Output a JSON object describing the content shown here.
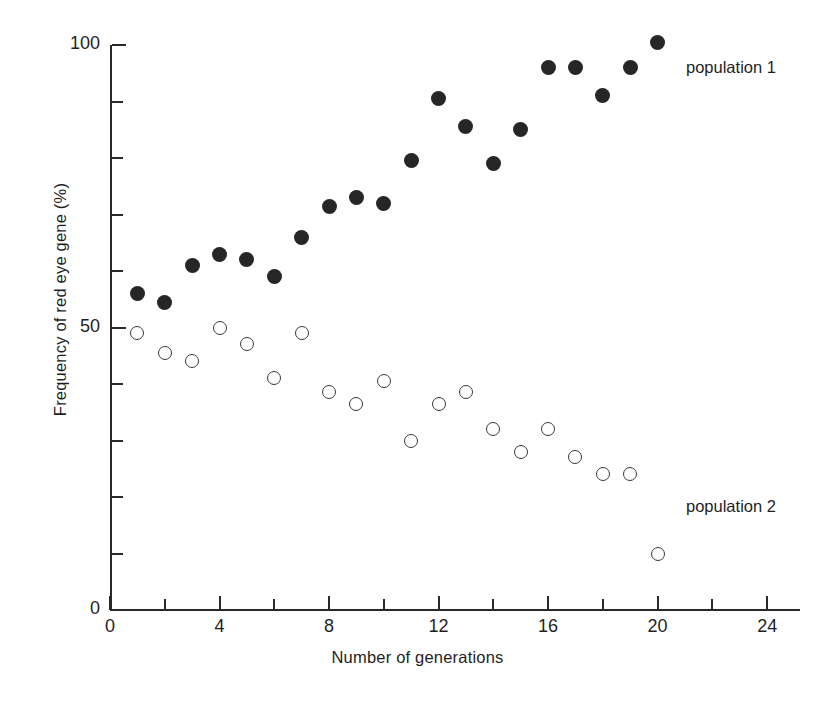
{
  "chart_data": {
    "type": "scatter",
    "title": "",
    "xlabel": "Number of generations",
    "ylabel": "Frequency of red eye gene (%)",
    "xlim": [
      0,
      25
    ],
    "ylim": [
      0,
      100
    ],
    "grid": false,
    "legend_position": "inline-annotation-right",
    "x_ticks_major": [
      0,
      4,
      8,
      12,
      16,
      20,
      24
    ],
    "x_ticks_minor": [
      2,
      6,
      10,
      14,
      18,
      22
    ],
    "x_tick_labels": [
      "0",
      "4",
      "8",
      "12",
      "16",
      "20",
      "24"
    ],
    "y_ticks_major": [
      0,
      50,
      100
    ],
    "y_ticks_minor": [
      10,
      20,
      30,
      40,
      60,
      70,
      80,
      90
    ],
    "y_tick_labels": [
      "0",
      "50",
      "100"
    ],
    "x": [
      1,
      2,
      3,
      4,
      5,
      6,
      7,
      8,
      9,
      10,
      11,
      12,
      13,
      14,
      15,
      16,
      17,
      18,
      19,
      20
    ],
    "series": [
      {
        "name": "population 1",
        "marker": "filled-circle",
        "color": "#262626",
        "annotation": "population 1",
        "values": [
          56,
          54.5,
          61,
          63,
          62,
          59,
          66,
          71.5,
          73,
          72,
          79.5,
          90.5,
          85.5,
          79,
          85,
          96,
          96,
          91,
          96,
          100.5
        ]
      },
      {
        "name": "population 2",
        "marker": "open-circle",
        "color": "#3a3a3a",
        "annotation": "population 2",
        "values": [
          49,
          45.5,
          44,
          50,
          47,
          41,
          49,
          38.5,
          36.5,
          40.5,
          30,
          36.5,
          38.5,
          32,
          28,
          32,
          27,
          24,
          24,
          10
        ]
      }
    ]
  },
  "axis_geometry": {
    "plot_left_px": 110,
    "plot_right_px": 800,
    "plot_top_px": 45,
    "plot_bottom_px": 610,
    "x_min": 0,
    "x_max": 25.2,
    "y_min": 0,
    "y_max": 100
  }
}
